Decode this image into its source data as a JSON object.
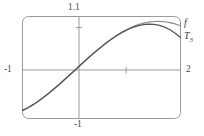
{
  "figure": {
    "title": "",
    "background_color": "#ffffff",
    "frame_color": "#9a9a9a",
    "axis_color": "#9a9a9a",
    "curve_f_color": "#8a8a8a",
    "curve_t3_color": "#555555"
  },
  "labels": {
    "top": "1.1",
    "left": "-1",
    "right": "2",
    "bottom": "-1",
    "curve_f": "f",
    "curve_t3_base": "T",
    "curve_t3_sub": "3"
  },
  "chart_data": {
    "type": "line",
    "title": "",
    "xlabel": "",
    "ylabel": "",
    "xlim": [
      -1,
      2
    ],
    "ylim": [
      -1,
      1.1
    ],
    "grid": false,
    "legend_position": "right-outside",
    "axis_ticks": {
      "x": [
        -1,
        1,
        2
      ],
      "y": [
        -1,
        1,
        1.1
      ]
    },
    "tick_labels": {
      "x_left": "-1",
      "x_right": "2",
      "y_top": "1.1",
      "y_bottom": "-1"
    },
    "x": [
      -1.0,
      -0.9,
      -0.8,
      -0.7,
      -0.6,
      -0.5,
      -0.4,
      -0.3,
      -0.2,
      -0.1,
      0.0,
      0.1,
      0.2,
      0.3,
      0.4,
      0.5,
      0.6,
      0.7,
      0.8,
      0.9,
      1.0,
      1.1,
      1.2,
      1.3,
      1.4,
      1.5,
      1.6,
      1.7,
      1.8,
      1.9,
      2.0
    ],
    "series": [
      {
        "name": "f",
        "label": "f",
        "color": "#8a8a8a",
        "values": [
          -0.841,
          -0.783,
          -0.717,
          -0.644,
          -0.565,
          -0.479,
          -0.389,
          -0.296,
          -0.199,
          -0.1,
          0.0,
          0.1,
          0.199,
          0.296,
          0.389,
          0.479,
          0.565,
          0.644,
          0.717,
          0.783,
          0.841,
          0.891,
          0.932,
          0.964,
          0.985,
          0.997,
          1.0,
          0.992,
          0.974,
          0.946,
          0.909
        ]
      },
      {
        "name": "T3",
        "label": "T₃",
        "color": "#555555",
        "values": [
          -0.833,
          -0.779,
          -0.715,
          -0.643,
          -0.564,
          -0.479,
          -0.389,
          -0.296,
          -0.199,
          -0.1,
          0.0,
          0.1,
          0.199,
          0.296,
          0.389,
          0.479,
          0.564,
          0.643,
          0.715,
          0.779,
          0.833,
          0.878,
          0.912,
          0.934,
          0.943,
          0.938,
          0.917,
          0.881,
          0.828,
          0.757,
          0.667
        ]
      }
    ],
    "annotations": [
      {
        "text": "1.1",
        "position": "top-of-y-axis"
      },
      {
        "text": "-1",
        "position": "left-of-x-axis"
      },
      {
        "text": "2",
        "position": "right-of-x-axis"
      },
      {
        "text": "-1",
        "position": "bottom-of-y-axis"
      },
      {
        "text": "f",
        "position": "right-end-upper-curve"
      },
      {
        "text": "T3",
        "position": "right-end-lower-curve"
      }
    ]
  }
}
